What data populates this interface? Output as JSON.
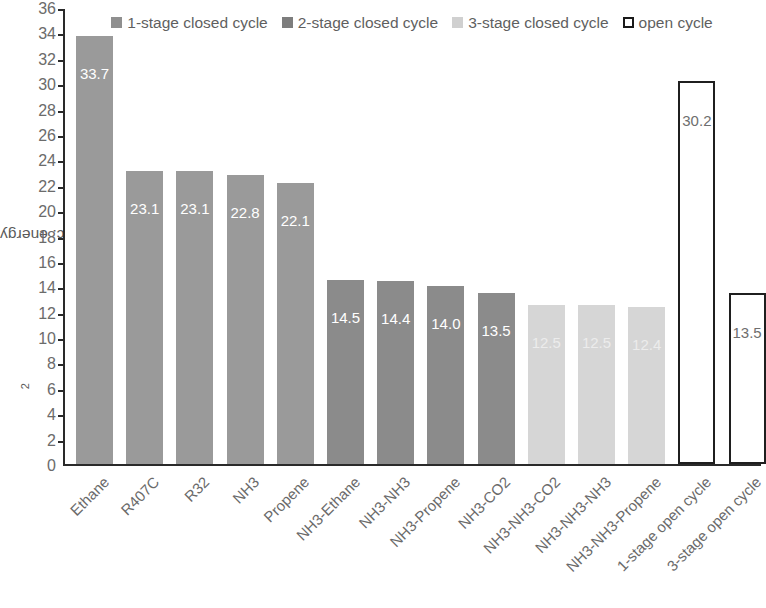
{
  "axis": {
    "y_title_main": "Minimum spec. energy demand in kWh/t CO",
    "y_title_sub": "2",
    "y_ticks": [
      "36",
      "34",
      "32",
      "30",
      "28",
      "26",
      "24",
      "22",
      "20",
      "18",
      "16",
      "14",
      "12",
      "10",
      "8",
      "6",
      "4",
      "2",
      "0"
    ]
  },
  "legend": {
    "items": [
      {
        "label": "1-stage closed cycle",
        "swatch": "filled-square-medium-gray",
        "color": "#8f8f8f"
      },
      {
        "label": "2-stage closed cycle",
        "swatch": "filled-square-dark-gray",
        "color": "#7d7d7d"
      },
      {
        "label": "3-stage closed cycle",
        "swatch": "filled-square-light-gray",
        "color": "#d0d0d0"
      },
      {
        "label": "open cycle",
        "swatch": "outlined-square-white",
        "color": "#ffffff"
      }
    ]
  },
  "chart_data": {
    "type": "bar",
    "title": "",
    "xlabel": "",
    "ylabel": "Minimum spec. energy demand in kWh/t CO2",
    "ylim": [
      0,
      36
    ],
    "ytick_step": 2,
    "grid": false,
    "legend_position": "top-center-inside",
    "categories": [
      "Ethane",
      "R407C",
      "R32",
      "NH3",
      "Propene",
      "NH3-Ethane",
      "NH3-NH3",
      "NH3-Propene",
      "NH3-CO2",
      "NH3-NH3-CO2",
      "NH3-NH3-NH3",
      "NH3-NH3-Propene",
      "1-stage open cycle",
      "3-stage open cycle"
    ],
    "values": [
      33.7,
      23.1,
      23.1,
      22.8,
      22.1,
      14.5,
      14.4,
      14.0,
      13.5,
      12.5,
      12.5,
      12.4,
      30.2,
      13.5
    ],
    "value_labels": [
      "33.7",
      "23.1",
      "23.1",
      "22.8",
      "22.1",
      "14.5",
      "14.4",
      "14.0",
      "13.5",
      "12.5",
      "12.5",
      "12.4",
      "30.2",
      "13.5"
    ],
    "series_group": [
      "1-stage closed cycle",
      "1-stage closed cycle",
      "1-stage closed cycle",
      "1-stage closed cycle",
      "1-stage closed cycle",
      "2-stage closed cycle",
      "2-stage closed cycle",
      "2-stage closed cycle",
      "2-stage closed cycle",
      "3-stage closed cycle",
      "3-stage closed cycle",
      "3-stage closed cycle",
      "open cycle",
      "open cycle"
    ],
    "group_colors": {
      "1-stage closed cycle": "#9a9a9a",
      "2-stage closed cycle": "#8b8b8b",
      "3-stage closed cycle": "#d6d6d6",
      "open cycle": "#ffffff"
    }
  }
}
